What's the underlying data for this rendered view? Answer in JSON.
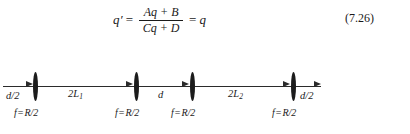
{
  "equation": {
    "lhs": "q′",
    "equals_1": "=",
    "numerator": "Aq + B",
    "denominator": "Cq + D",
    "equals_2": "=",
    "rhs": "q",
    "number": "(7.26)"
  },
  "diagram": {
    "type": "optical-resonator-unfolded",
    "axis_label": "optical axis",
    "lenses": [
      {
        "id": "lens-1",
        "x": 35,
        "focal_label_f": "f",
        "focal_label_eq": "=",
        "focal_label_value": "R/2"
      },
      {
        "id": "lens-2",
        "x": 136,
        "focal_label_f": "f",
        "focal_label_eq": "=",
        "focal_label_value": "R/2"
      },
      {
        "id": "lens-3",
        "x": 192,
        "focal_label_f": "f",
        "focal_label_eq": "=",
        "focal_label_value": "R/2"
      },
      {
        "id": "lens-4",
        "x": 293,
        "focal_label_f": "f",
        "focal_label_eq": "=",
        "focal_label_value": "R/2"
      }
    ],
    "segments": [
      {
        "id": "segment-d-half-left",
        "label": "d/2",
        "subscript": ""
      },
      {
        "id": "segment-2L1",
        "label": "2L",
        "subscript": "1"
      },
      {
        "id": "segment-d",
        "label": "d",
        "subscript": ""
      },
      {
        "id": "segment-2L2",
        "label": "2L",
        "subscript": "2"
      },
      {
        "id": "segment-d-half-right",
        "label": "d/2",
        "subscript": ""
      }
    ]
  },
  "colors": {
    "ink": "#1a1a1a",
    "line": "#2b2b2b",
    "lens": "#1c1c1c",
    "page_background": "#ffffff"
  }
}
